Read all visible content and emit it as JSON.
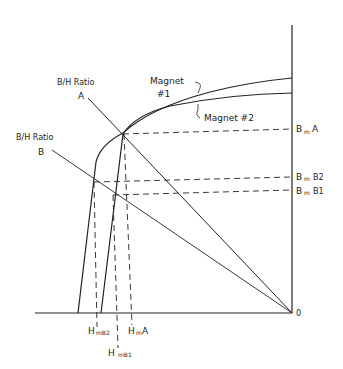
{
  "diagram": {
    "type": "demagnetization-curves",
    "origin_label": "0",
    "curves": [
      {
        "name": "magnet-1",
        "label_line1": "Magnet",
        "label_line2": "#1"
      },
      {
        "name": "magnet-2",
        "label": "Magnet #2"
      }
    ],
    "load_lines": [
      {
        "name": "ratio-a",
        "label_line1": "B/H Ratio",
        "label_line2": "A"
      },
      {
        "name": "ratio-b",
        "label_line1": "B/H Ratio",
        "label_line2": "B"
      }
    ],
    "b_labels": {
      "bma": {
        "main": "B",
        "sub": "m",
        "tail": "A"
      },
      "bmb2": {
        "main": "B",
        "sub": "m",
        "tail": "B2"
      },
      "bmb1": {
        "main": "B",
        "sub": "m",
        "tail": "B1"
      }
    },
    "h_labels": {
      "hmb2": {
        "main": "H",
        "sub": "mB2"
      },
      "hma": {
        "main": "H",
        "sub": "m",
        "tail": "A"
      },
      "hmb1": {
        "main": "H",
        "sub": "mB1"
      }
    },
    "colors": {
      "line": "#222222",
      "background": "#ffffff"
    }
  }
}
